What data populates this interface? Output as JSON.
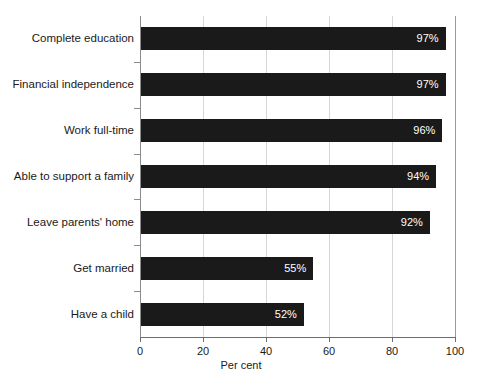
{
  "chart_data": {
    "type": "bar",
    "orientation": "horizontal",
    "title": "",
    "xlabel": "Per cent",
    "ylabel": "",
    "xlim": [
      0,
      100
    ],
    "xticks": [
      0,
      20,
      40,
      60,
      80,
      100
    ],
    "grid": true,
    "legend": null,
    "categories": [
      "Complete education",
      "Financial independence",
      "Work full-time",
      "Able to support a family",
      "Leave parents' home",
      "Get married",
      "Have a child"
    ],
    "values": [
      97,
      97,
      96,
      94,
      92,
      55,
      52
    ],
    "value_labels": [
      "97%",
      "97%",
      "96%",
      "94%",
      "92%",
      "55%",
      "52%"
    ],
    "bar_color": "#1a1a1a",
    "value_label_color": "#ffffff",
    "gridline_color": "#d6d6d6",
    "axis_color": "#6e6e6e"
  },
  "axis": {
    "x_tick_labels": [
      "0",
      "20",
      "40",
      "60",
      "80",
      "100"
    ],
    "x_title": "Per cent"
  }
}
